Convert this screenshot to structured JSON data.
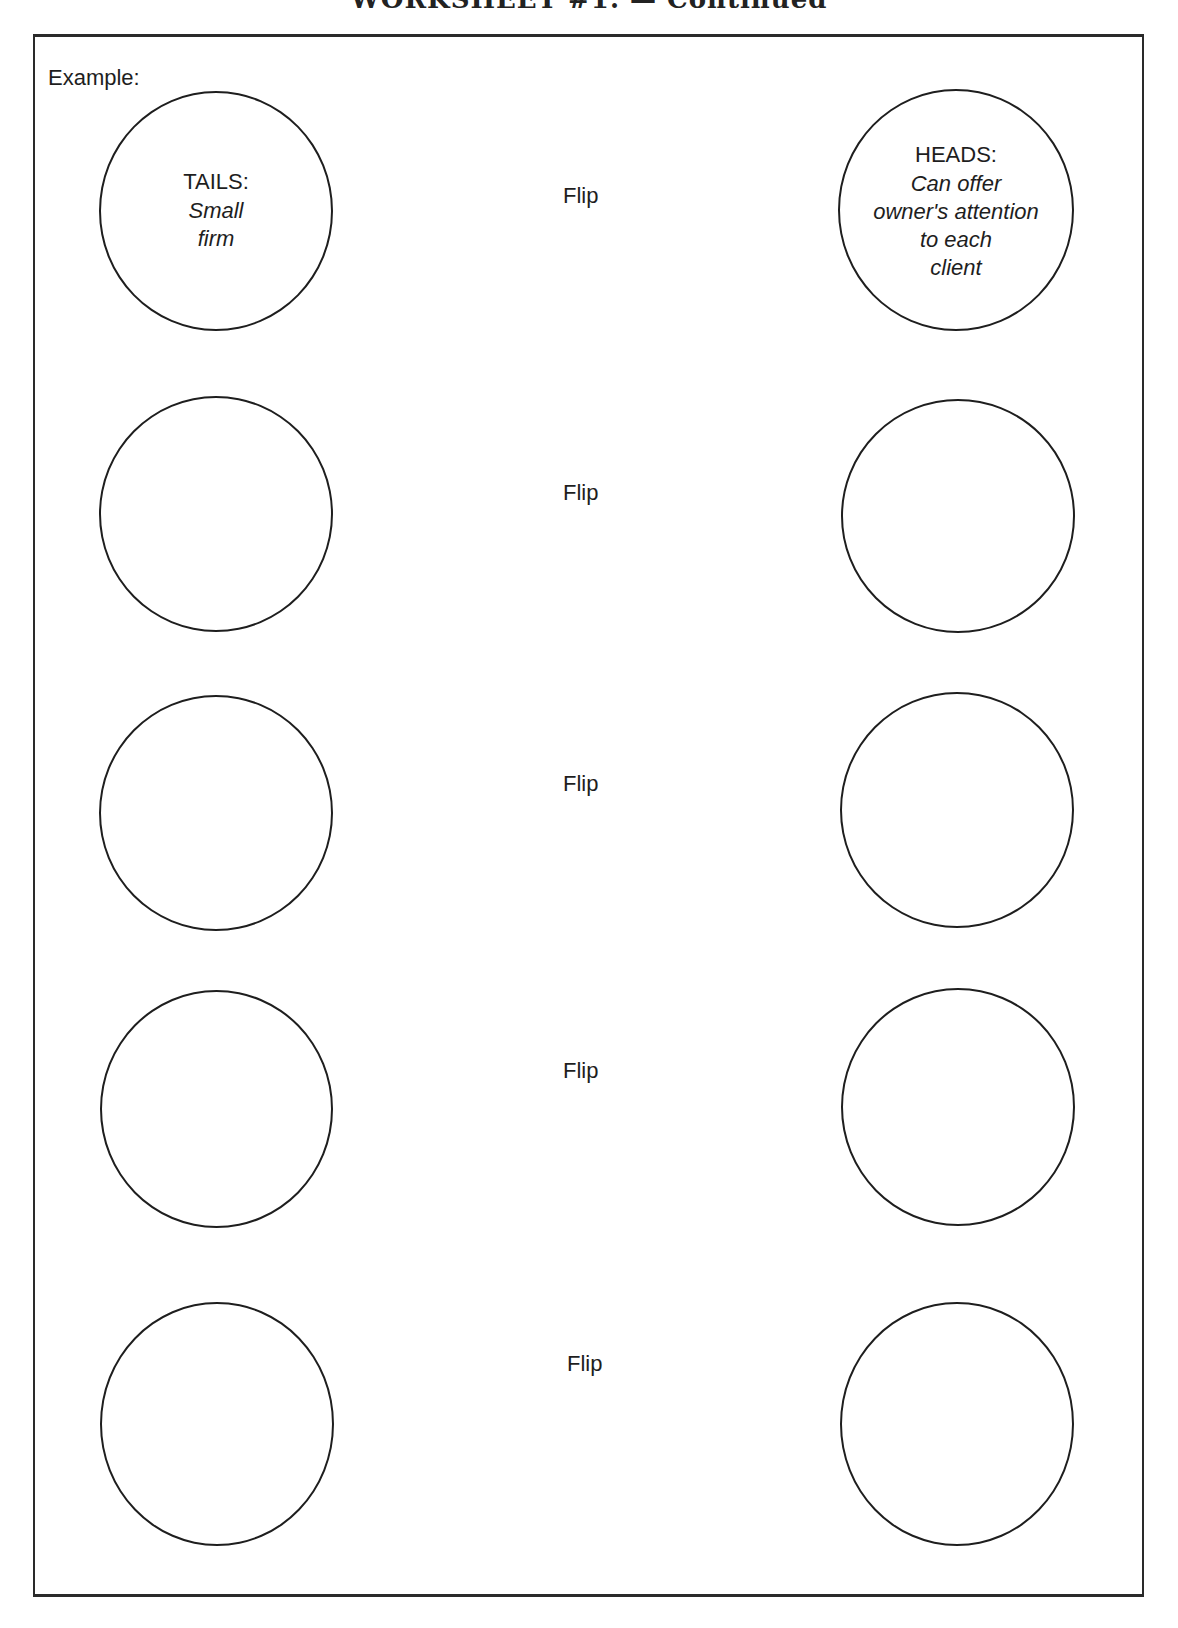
{
  "header": {
    "title": "WORKSHEET #1. — Continued"
  },
  "worksheet": {
    "example_label": "Example:",
    "rows": [
      {
        "tails": {
          "side_label": "TAILS:",
          "description_lines": [
            "Small",
            "firm"
          ]
        },
        "flip_label": "Flip",
        "heads": {
          "side_label": "HEADS:",
          "description_lines": [
            "Can offer",
            "owner's attention",
            "to each",
            "client"
          ]
        }
      },
      {
        "tails": {
          "side_label": "",
          "description_lines": []
        },
        "flip_label": "Flip",
        "heads": {
          "side_label": "",
          "description_lines": []
        }
      },
      {
        "tails": {
          "side_label": "",
          "description_lines": []
        },
        "flip_label": "Flip",
        "heads": {
          "side_label": "",
          "description_lines": []
        }
      },
      {
        "tails": {
          "side_label": "",
          "description_lines": []
        },
        "flip_label": "Flip",
        "heads": {
          "side_label": "",
          "description_lines": []
        }
      },
      {
        "tails": {
          "side_label": "",
          "description_lines": []
        },
        "flip_label": "Flip",
        "heads": {
          "side_label": "",
          "description_lines": []
        }
      }
    ]
  }
}
